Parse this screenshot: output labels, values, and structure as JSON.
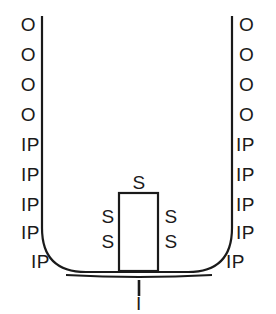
{
  "figure": {
    "background_color": "#ffffff",
    "stroke_color": "#1a1a1a"
  },
  "boundary_labels": {
    "left_wall": [
      {
        "text": "O",
        "x": 36,
        "y": 24
      },
      {
        "text": "O",
        "x": 36,
        "y": 54
      },
      {
        "text": "O",
        "x": 36,
        "y": 84
      },
      {
        "text": "O",
        "x": 36,
        "y": 114
      },
      {
        "text": "IP",
        "x": 40,
        "y": 144
      },
      {
        "text": "IP",
        "x": 40,
        "y": 174
      },
      {
        "text": "IP",
        "x": 40,
        "y": 204
      },
      {
        "text": "IP",
        "x": 40,
        "y": 232
      },
      {
        "text": "IP",
        "x": 50,
        "y": 261
      }
    ],
    "right_wall": [
      {
        "text": "O",
        "x": 239,
        "y": 24
      },
      {
        "text": "O",
        "x": 239,
        "y": 54
      },
      {
        "text": "O",
        "x": 239,
        "y": 84
      },
      {
        "text": "O",
        "x": 239,
        "y": 114
      },
      {
        "text": "IP",
        "x": 236,
        "y": 144
      },
      {
        "text": "IP",
        "x": 236,
        "y": 174
      },
      {
        "text": "IP",
        "x": 236,
        "y": 204
      },
      {
        "text": "IP",
        "x": 236,
        "y": 232
      },
      {
        "text": "IP",
        "x": 226,
        "y": 261
      }
    ],
    "obstacle": [
      {
        "text": "S",
        "x": 139,
        "y": 182,
        "position": "top"
      },
      {
        "text": "S",
        "x": 108,
        "y": 216,
        "position": "left-upper"
      },
      {
        "text": "S",
        "x": 108,
        "y": 241,
        "position": "left-lower"
      },
      {
        "text": "S",
        "x": 171,
        "y": 216,
        "position": "right-upper"
      },
      {
        "text": "S",
        "x": 171,
        "y": 241,
        "position": "right-lower"
      }
    ],
    "bottom": [
      {
        "text": "I",
        "x": 139,
        "y": 303
      }
    ]
  },
  "geometry": {
    "left_wall_x": 42,
    "right_wall_x": 232,
    "wall_top_y": 16,
    "wall_bottom_y": 228,
    "corner_radius": 44,
    "floor_y": 273,
    "obstacle": {
      "x": 119,
      "y": 193,
      "width": 39,
      "height": 78
    },
    "inlet_tick": {
      "x": 139,
      "y_top": 280,
      "y_bottom": 296
    },
    "stroke_width": 2.2
  },
  "legend_meaning": {
    "O": "open / outflow boundary",
    "IP": "impermeable boundary",
    "S": "solid obstacle boundary",
    "I": "inlet"
  }
}
